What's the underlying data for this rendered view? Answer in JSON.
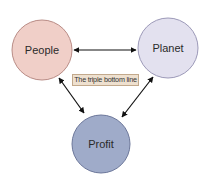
{
  "diagram": {
    "nodes": [
      {
        "id": "people",
        "label": "People",
        "fill": "#f0cfc8",
        "stroke": "#b98c86"
      },
      {
        "id": "planet",
        "label": "Planet",
        "fill": "#e3e1ef",
        "stroke": "#9c99b8"
      },
      {
        "id": "profit",
        "label": "Profit",
        "fill": "#9fabc9",
        "stroke": "#6c779a"
      }
    ],
    "edges": [
      {
        "from": "people",
        "to": "planet",
        "direction": "both"
      },
      {
        "from": "people",
        "to": "profit",
        "direction": "both"
      },
      {
        "from": "planet",
        "to": "profit",
        "direction": "both"
      }
    ],
    "caption": "The triple bottom line"
  }
}
